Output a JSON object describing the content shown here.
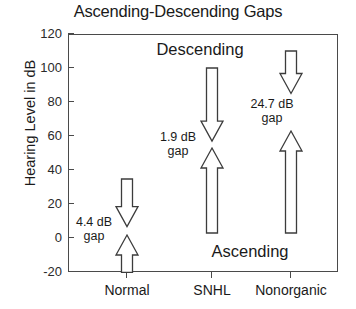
{
  "chart_data": {
    "type": "bar",
    "title": "Ascending-Descending Gaps",
    "xlabel": "",
    "ylabel": "Hearing Level in dB",
    "categories": [
      "Normal",
      "SNHL",
      "Nonorganic"
    ],
    "ylim": [
      -20,
      120
    ],
    "yticks": [
      -20,
      0,
      20,
      40,
      60,
      80,
      100,
      120
    ],
    "ytick_labels": [
      "-20",
      "0",
      "20",
      "40",
      "60",
      "80",
      "100",
      "120"
    ],
    "grid": false,
    "legend": "none",
    "series": [
      {
        "name": "Descending",
        "direction": "down",
        "values": [
          {
            "category": "Normal",
            "start_db": 35,
            "end_db": 7
          },
          {
            "category": "SNHL",
            "start_db": 100,
            "end_db": 57
          },
          {
            "category": "Nonorganic",
            "start_db": 110,
            "end_db": 85
          }
        ]
      },
      {
        "name": "Ascending",
        "direction": "up",
        "values": [
          {
            "category": "Normal",
            "start_db": -20,
            "end_db": 2
          },
          {
            "category": "SNHL",
            "start_db": 3,
            "end_db": 53
          },
          {
            "category": "Nonorganic",
            "start_db": 3,
            "end_db": 63
          }
        ]
      }
    ],
    "gaps": [
      {
        "category": "Normal",
        "value": 4.4,
        "label_line1": "4.4 dB",
        "label_line2": "gap"
      },
      {
        "category": "SNHL",
        "value": 1.9,
        "label_line1": "1.9 dB",
        "label_line2": "gap"
      },
      {
        "category": "Nonorganic",
        "value": 24.7,
        "label_line1": "24.7 dB",
        "label_line2": "gap"
      }
    ],
    "annotations": [
      {
        "text": "Descending",
        "position": "upper-center"
      },
      {
        "text": "Ascending",
        "position": "lower-center"
      }
    ],
    "colors": {
      "arrow_fill": "#ffffff",
      "arrow_outline": "#3c3c3c",
      "axis": "#4a4a4a",
      "text": "#1a1a1a",
      "background": "#ffffff"
    }
  }
}
